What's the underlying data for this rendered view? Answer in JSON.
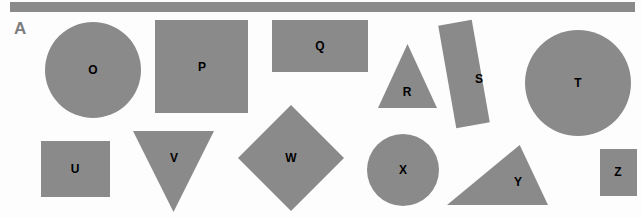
{
  "figure": {
    "panel_label": "A",
    "background_color": "#fdfdfd",
    "shape_color": "#8a8a8a",
    "letter_color": "#000000",
    "label_color": "#7d7d7d",
    "width": 641,
    "height": 218
  },
  "top_bar": {
    "name": "header-bar",
    "color": "#8a8a8a",
    "x": 10,
    "y": 2,
    "width": 625,
    "height": 10
  },
  "shapes": [
    {
      "letter": "O",
      "kind": "circle",
      "x": 45,
      "y": 22,
      "width": 96,
      "height": 96,
      "label_x": 93,
      "label_y": 70
    },
    {
      "letter": "P",
      "kind": "square",
      "x": 155,
      "y": 20,
      "width": 93,
      "height": 93,
      "label_x": 202,
      "label_y": 67
    },
    {
      "letter": "Q",
      "kind": "rectangle",
      "x": 272,
      "y": 20,
      "width": 96,
      "height": 52,
      "label_x": 320,
      "label_y": 46
    },
    {
      "letter": "R",
      "kind": "triangle-up",
      "x": 378,
      "y": 44,
      "width": 59,
      "height": 64,
      "label_x": 407,
      "label_y": 92
    },
    {
      "letter": "S",
      "kind": "rotated-rectangle",
      "x": 447,
      "y": 22,
      "width": 34,
      "height": 104,
      "rotation": -10,
      "label_x": 479,
      "label_y": 79
    },
    {
      "letter": "T",
      "kind": "circle",
      "x": 525,
      "y": 30,
      "width": 106,
      "height": 106,
      "label_x": 578,
      "label_y": 83
    },
    {
      "letter": "U",
      "kind": "square",
      "x": 41,
      "y": 141,
      "width": 69,
      "height": 56,
      "label_x": 75,
      "label_y": 169
    },
    {
      "letter": "V",
      "kind": "triangle-down",
      "x": 133,
      "y": 131,
      "width": 81,
      "height": 81,
      "label_x": 174,
      "label_y": 158
    },
    {
      "letter": "W",
      "kind": "diamond",
      "x": 238,
      "y": 105,
      "width": 106,
      "height": 106,
      "label_x": 291,
      "label_y": 158
    },
    {
      "letter": "X",
      "kind": "circle",
      "x": 367,
      "y": 134,
      "width": 72,
      "height": 72,
      "label_x": 403,
      "label_y": 170
    },
    {
      "letter": "Y",
      "kind": "triangle-scalene",
      "x": 447,
      "y": 145,
      "width": 101,
      "height": 60,
      "label_x": 518,
      "label_y": 182
    },
    {
      "letter": "Z",
      "kind": "square",
      "x": 600,
      "y": 149,
      "width": 37,
      "height": 47,
      "label_x": 618,
      "label_y": 172
    }
  ]
}
